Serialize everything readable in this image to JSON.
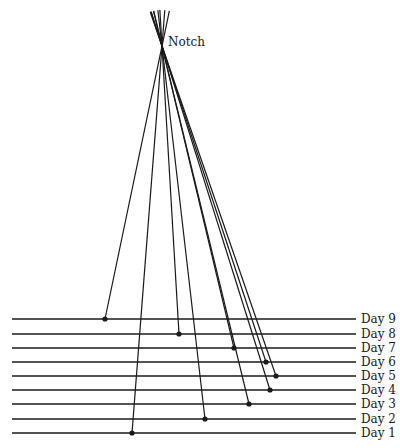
{
  "diagram": {
    "notch": {
      "label": "Notch",
      "x": 162,
      "y": 46,
      "label_x": 168,
      "label_y": 46
    },
    "extension_length": 36,
    "line_x_start": 12,
    "line_x_end": 356,
    "label_x": 361,
    "days": [
      {
        "label": "Day 9",
        "y": 319,
        "dot_x": 105
      },
      {
        "label": "Day 8",
        "y": 334,
        "dot_x": 179
      },
      {
        "label": "Day 7",
        "y": 348,
        "dot_x": 234
      },
      {
        "label": "Day 6",
        "y": 362,
        "dot_x": 266
      },
      {
        "label": "Day 5",
        "y": 376,
        "dot_x": 276
      },
      {
        "label": "Day 4",
        "y": 390,
        "dot_x": 270
      },
      {
        "label": "Day 3",
        "y": 404,
        "dot_x": 249
      },
      {
        "label": "Day 2",
        "y": 419,
        "dot_x": 205
      },
      {
        "label": "Day 1",
        "y": 433,
        "dot_x": 132
      }
    ],
    "colors": {
      "ink": "#1a1a1a",
      "background": "#ffffff"
    }
  }
}
